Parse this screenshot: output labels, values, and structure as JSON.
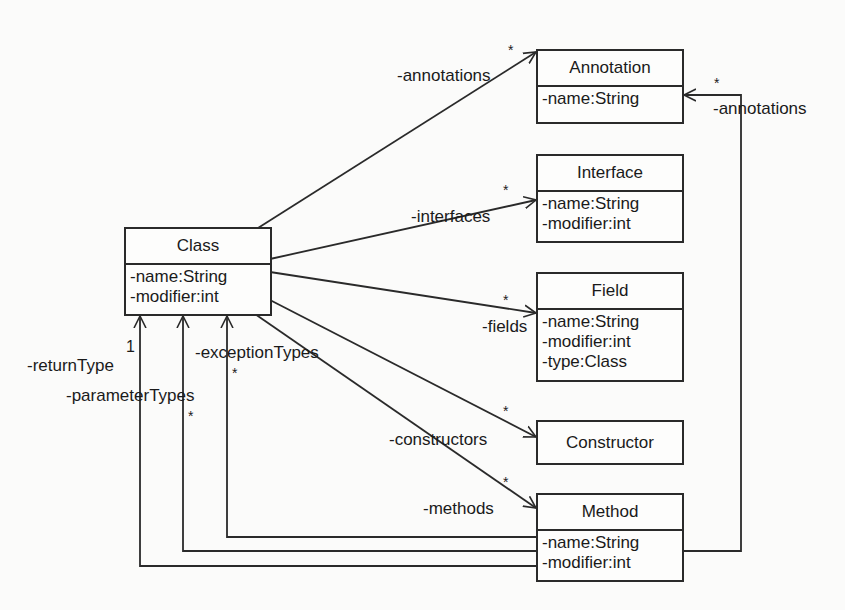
{
  "diagram": {
    "type": "UML class diagram",
    "classes": {
      "class": {
        "name": "Class",
        "attributes": [
          "-name:String",
          "-modifier:int"
        ]
      },
      "annotation": {
        "name": "Annotation",
        "attributes": [
          "-name:String"
        ]
      },
      "interface": {
        "name": "Interface",
        "attributes": [
          "-name:String",
          "-modifier:int"
        ]
      },
      "field": {
        "name": "Field",
        "attributes": [
          "-name:String",
          "-modifier:int",
          "-type:Class"
        ]
      },
      "constructor": {
        "name": "Constructor",
        "attributes": []
      },
      "method": {
        "name": "Method",
        "attributes": [
          "-name:String",
          "-modifier:int"
        ]
      }
    },
    "associations": {
      "annotations": {
        "from": "Class",
        "to": "Annotation",
        "role": "-annotations",
        "multiplicity": "*"
      },
      "interfaces": {
        "from": "Class",
        "to": "Interface",
        "role": "-interfaces",
        "multiplicity": "*"
      },
      "fields": {
        "from": "Class",
        "to": "Field",
        "role": "-fields",
        "multiplicity": "*"
      },
      "constructors": {
        "from": "Class",
        "to": "Constructor",
        "role": "-constructors",
        "multiplicity": "*"
      },
      "methods": {
        "from": "Class",
        "to": "Method",
        "role": "-methods",
        "multiplicity": "*"
      },
      "method_annotations": {
        "from": "Method",
        "to": "Annotation",
        "role": "-annotations",
        "multiplicity": "*"
      },
      "return_type": {
        "from": "Method",
        "to": "Class",
        "role": "-returnType",
        "multiplicity": "1"
      },
      "parameter_types": {
        "from": "Method",
        "to": "Class",
        "role": "-parameterTypes",
        "multiplicity": "*"
      },
      "exception_types": {
        "from": "Method",
        "to": "Class",
        "role": "-exceptionTypes",
        "multiplicity": "*"
      }
    }
  }
}
